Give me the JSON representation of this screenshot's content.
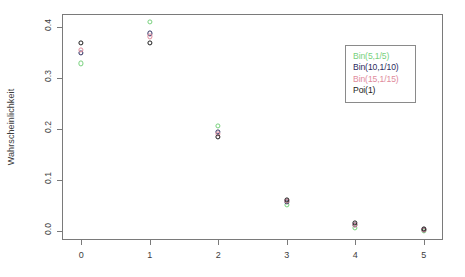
{
  "chart_data": {
    "type": "scatter",
    "title": "",
    "subtitle": "",
    "xlabel": "",
    "ylabel": "Wahrscheinlichkeit",
    "x": [
      0,
      1,
      2,
      3,
      4,
      5
    ],
    "xticklabels": [
      "0",
      "1",
      "2",
      "3",
      "4",
      "5"
    ],
    "yticks": [
      0.0,
      0.1,
      0.2,
      0.3,
      0.4
    ],
    "yticklabels": [
      "0.0",
      "0.1",
      "0.2",
      "0.3",
      "0.4"
    ],
    "xlim": [
      -0.28,
      5.28
    ],
    "ylim": [
      -0.018,
      0.425
    ],
    "grid": false,
    "legend_position": "top-right",
    "marker": "open-circle",
    "series": [
      {
        "name": "Bin(5,1/5)",
        "color": "#77d17c",
        "values": [
          0.328,
          0.41,
          0.205,
          0.051,
          0.006,
          0.0003
        ]
      },
      {
        "name": "Bin(10,1/10)",
        "color": "#2b2b5e",
        "values": [
          0.349,
          0.387,
          0.194,
          0.057,
          0.011,
          0.0015
        ]
      },
      {
        "name": "Bin(15,1/15)",
        "color": "#e08b9c",
        "values": [
          0.355,
          0.381,
          0.19,
          0.059,
          0.012,
          0.0019
        ]
      },
      {
        "name": "Poi(1)",
        "color": "#1a1a1a",
        "values": [
          0.368,
          0.368,
          0.184,
          0.061,
          0.015,
          0.0031
        ]
      }
    ]
  },
  "legend": {
    "items": [
      {
        "label": "Bin(5,1/5)",
        "color": "#77d17c"
      },
      {
        "label": "Bin(10,1/10)",
        "color": "#2b2b5e"
      },
      {
        "label": "Bin(15,1/15)",
        "color": "#e08b9c"
      },
      {
        "label": "Poi(1)",
        "color": "#1a1a1a"
      }
    ]
  },
  "axes": {
    "y_title": "Wahrscheinlichkeit",
    "y_tick_labels": [
      "0.0",
      "0.1",
      "0.2",
      "0.3",
      "0.4"
    ],
    "x_tick_labels": [
      "0",
      "1",
      "2",
      "3",
      "4",
      "5"
    ]
  },
  "colors": {
    "frame": "#7a7a7a",
    "text": "#3d3d3d",
    "background": "#ffffff"
  }
}
